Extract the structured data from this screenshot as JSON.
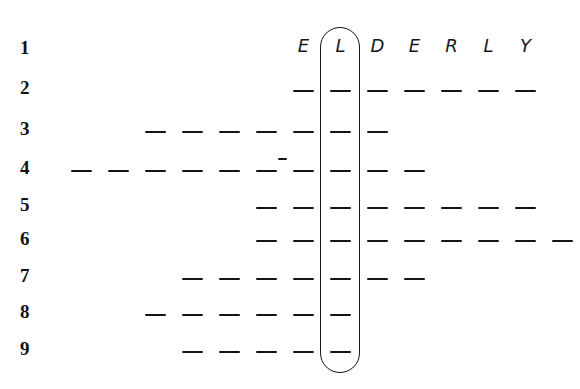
{
  "puzzle": {
    "title": "ELDERLY word-column puzzle grid",
    "keyword": "ELDERLY",
    "keyword_letters": [
      "E",
      "L",
      "D",
      "E",
      "R",
      "L",
      "Y"
    ],
    "highlighted_letter": "L",
    "highlighted_column_index": 1,
    "row_numbers": [
      "1",
      "2",
      "3",
      "4",
      "5",
      "6",
      "7",
      "8",
      "9"
    ],
    "row_count": 9,
    "keyword_column_x": [
      293,
      330,
      367,
      404,
      441,
      478,
      515
    ],
    "column_pitch": 37,
    "row_y": [
      48,
      90,
      131,
      170,
      207,
      240,
      278,
      314,
      351
    ],
    "rows": [
      {
        "number": "1",
        "type": "letters",
        "blank_count": 0,
        "letters": [
          "E",
          "L",
          "D",
          "E",
          "R",
          "L",
          "Y"
        ],
        "blank_x_positions": []
      },
      {
        "number": "2",
        "type": "blanks",
        "blank_count": 7,
        "blank_x_positions": [
          293,
          330,
          367,
          404,
          441,
          478,
          515
        ]
      },
      {
        "number": "3",
        "type": "blanks",
        "blank_count": 7,
        "blank_x_positions": [
          145,
          182,
          219,
          256,
          293,
          330,
          367
        ]
      },
      {
        "number": "4",
        "type": "blanks",
        "blank_count": 10,
        "blank_x_positions": [
          71,
          108,
          145,
          182,
          219,
          256,
          293,
          330,
          367,
          404
        ],
        "tick_marks": [
          {
            "x": 278,
            "y": 158
          }
        ]
      },
      {
        "number": "5",
        "type": "blanks",
        "blank_count": 8,
        "blank_x_positions": [
          256,
          293,
          330,
          367,
          404,
          441,
          478,
          515
        ]
      },
      {
        "number": "6",
        "type": "blanks",
        "blank_count": 9,
        "blank_x_positions": [
          256,
          293,
          330,
          367,
          404,
          441,
          478,
          515,
          552
        ]
      },
      {
        "number": "7",
        "type": "blanks",
        "blank_count": 7,
        "blank_x_positions": [
          182,
          219,
          256,
          293,
          330,
          367,
          404
        ]
      },
      {
        "number": "8",
        "type": "blanks",
        "blank_count": 6,
        "blank_x_positions": [
          145,
          182,
          219,
          256,
          293,
          330
        ]
      },
      {
        "number": "9",
        "type": "blanks",
        "blank_count": 5,
        "blank_x_positions": [
          182,
          219,
          256,
          293,
          330
        ]
      }
    ],
    "capsule": {
      "x": 320,
      "y": 27,
      "width": 40,
      "height": 346,
      "label": "highlight-capsule-around-L-column"
    },
    "colors": {
      "ink": "#141418",
      "paper": "#ffffff",
      "letter_ink": "#17171c"
    },
    "metrics": {
      "blank_width": 21,
      "blank_thickness": 2.6,
      "tick_width": 9
    }
  }
}
